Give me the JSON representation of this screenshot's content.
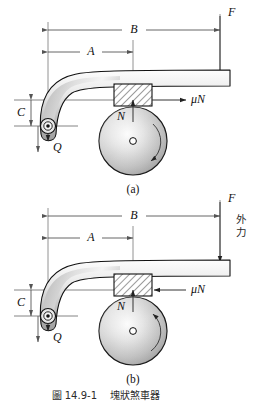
{
  "figure": {
    "caption_number": "圖 14.9-1",
    "caption_title": "塊狀煞車器",
    "sublabel_a": "(a)",
    "sublabel_b": "(b)"
  },
  "colors": {
    "ink": "#111111",
    "dim_line": "#555555",
    "lever_fill_light": "#f2f2f2",
    "lever_fill_dark": "#9a9a9a",
    "drum_light": "#fbfbfb",
    "drum_dark": "#8e8e8e",
    "hatch_line": "#222222",
    "background": "#ffffff"
  },
  "diagram_a": {
    "name": "(a)",
    "dimensions": [
      {
        "id": "B",
        "label": "B",
        "orientation": "horizontal",
        "note": "pivot to applied force F"
      },
      {
        "id": "A",
        "label": "A",
        "orientation": "horizontal",
        "note": "pivot to brake block center"
      },
      {
        "id": "C",
        "label": "C",
        "orientation": "vertical",
        "note": "pivot to contact line offset"
      }
    ],
    "forces": [
      {
        "id": "F",
        "label": "F",
        "direction": "down",
        "note": "applied lever force at right end"
      },
      {
        "id": "Q",
        "label": "Q",
        "direction": "down",
        "note": "pin reaction at pivot"
      },
      {
        "id": "N",
        "label": "N",
        "direction": "up",
        "note": "normal force on block"
      },
      {
        "id": "muN",
        "label": "μN",
        "direction": "right",
        "note": "friction force on block"
      }
    ],
    "drum": {
      "rotation": "clockwise",
      "center_label": ""
    }
  },
  "diagram_b": {
    "name": "(b)",
    "dimensions": [
      {
        "id": "B",
        "label": "B",
        "orientation": "horizontal",
        "note": "pivot to applied force F"
      },
      {
        "id": "A",
        "label": "A",
        "orientation": "horizontal",
        "note": "pivot to brake block center"
      },
      {
        "id": "C",
        "label": "C",
        "orientation": "vertical",
        "note": "pivot to contact line offset"
      }
    ],
    "forces": [
      {
        "id": "F",
        "label": "F",
        "direction": "down",
        "note": "applied lever force at right end"
      },
      {
        "id": "Q",
        "label": "Q",
        "direction": "down",
        "note": "pin reaction at pivot"
      },
      {
        "id": "N",
        "label": "N",
        "direction": "up",
        "note": "normal force on block"
      },
      {
        "id": "muN",
        "label": "μN",
        "direction": "left",
        "note": "friction force on block"
      }
    ],
    "annotation_vertical": "外力",
    "drum": {
      "rotation": "counterclockwise",
      "center_label": ""
    }
  }
}
